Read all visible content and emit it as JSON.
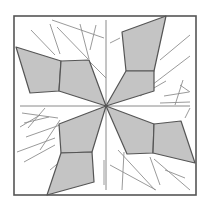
{
  "diagram": {
    "width": 210,
    "height": 209,
    "background": "#ffffff",
    "frame": {
      "x": 14,
      "y": 16,
      "w": 182,
      "h": 179,
      "stroke": "#555555",
      "stroke_width": 1.6
    },
    "center": [
      106,
      106
    ],
    "axes": [
      {
        "x1": 106,
        "y1": 20,
        "x2": 106,
        "y2": 190
      },
      {
        "x1": 20,
        "y1": 106,
        "x2": 190,
        "y2": 106
      }
    ],
    "axis_color": "#8a8a8a",
    "fill_color": "#c4c4c4",
    "outline_color": "#555555",
    "thin_line_color": "#8f8f8f",
    "shapes": [
      {
        "name": "left-petal-outer",
        "points": [
          [
            16,
            47
          ],
          [
            61,
            61
          ],
          [
            59,
            91
          ],
          [
            30,
            93
          ]
        ]
      },
      {
        "name": "left-petal-inner",
        "points": [
          [
            61,
            61
          ],
          [
            89,
            60
          ],
          [
            106,
            106
          ],
          [
            59,
            91
          ]
        ]
      },
      {
        "name": "top-petal-outer",
        "points": [
          [
            122,
            32
          ],
          [
            166,
            16
          ],
          [
            154,
            71
          ],
          [
            126,
            71
          ]
        ]
      },
      {
        "name": "top-petal-inner",
        "points": [
          [
            126,
            71
          ],
          [
            154,
            71
          ],
          [
            154,
            91
          ],
          [
            106,
            106
          ]
        ]
      },
      {
        "name": "right-petal-inner",
        "points": [
          [
            106,
            106
          ],
          [
            154,
            124
          ],
          [
            153,
            153
          ],
          [
            127,
            154
          ]
        ]
      },
      {
        "name": "right-petal-outer",
        "points": [
          [
            154,
            124
          ],
          [
            181,
            121
          ],
          [
            195,
            163
          ],
          [
            153,
            153
          ]
        ]
      },
      {
        "name": "bottom-petal-inner",
        "points": [
          [
            106,
            106
          ],
          [
            92,
            152
          ],
          [
            61,
            153
          ],
          [
            59,
            124
          ]
        ]
      },
      {
        "name": "bottom-petal-outer",
        "points": [
          [
            61,
            153
          ],
          [
            92,
            152
          ],
          [
            94,
            182
          ],
          [
            47,
            195
          ]
        ]
      }
    ],
    "thin_lines": [
      [
        31,
        30,
        55,
        55
      ],
      [
        50,
        24,
        60,
        54
      ],
      [
        57,
        27,
        88,
        59
      ],
      [
        52,
        20,
        104,
        38
      ],
      [
        80,
        24,
        89,
        59
      ],
      [
        96,
        25,
        90,
        50
      ],
      [
        88,
        60,
        106,
        78
      ],
      [
        110,
        43,
        120,
        38
      ],
      [
        160,
        60,
        190,
        35
      ],
      [
        148,
        88,
        190,
        56
      ],
      [
        140,
        96,
        166,
        81
      ],
      [
        164,
        96,
        189,
        92
      ],
      [
        180,
        85,
        190,
        92
      ],
      [
        160,
        103,
        190,
        102
      ],
      [
        183,
        80,
        175,
        105
      ],
      [
        22,
        113,
        58,
        118
      ],
      [
        24,
        123,
        49,
        117
      ],
      [
        28,
        128,
        45,
        108
      ],
      [
        26,
        137,
        60,
        125
      ],
      [
        17,
        152,
        55,
        138
      ],
      [
        24,
        162,
        55,
        145
      ],
      [
        40,
        150,
        60,
        120
      ],
      [
        20,
        127,
        40,
        115
      ],
      [
        185,
        118,
        190,
        108
      ],
      [
        118,
        150,
        155,
        190
      ],
      [
        124,
        152,
        122,
        190
      ],
      [
        150,
        157,
        160,
        185
      ],
      [
        154,
        159,
        190,
        190
      ],
      [
        110,
        165,
        156,
        190
      ],
      [
        104,
        160,
        104,
        185
      ],
      [
        62,
        160,
        75,
        175
      ],
      [
        165,
        170,
        185,
        178
      ],
      [
        50,
        170,
        62,
        160
      ]
    ]
  }
}
